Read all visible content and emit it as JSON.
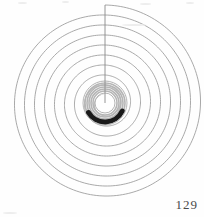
{
  "page": {
    "width": 204,
    "height": 217,
    "background_color": "#fefefe",
    "page_number": "129"
  },
  "figure": {
    "name": "archimedean-spiral-diagram",
    "caption": "",
    "center": {
      "x": 105,
      "y": 103
    },
    "radius_line": {
      "label": "vertical radius line",
      "from": {
        "x": 105,
        "y": 5
      },
      "to": {
        "x": 105,
        "y": 103
      },
      "color": "#8a8a8a",
      "width": 0.9
    },
    "spiral": {
      "type": "archimedean",
      "turns": 9,
      "start_radius": 8,
      "end_radius": 98,
      "start_angle_deg": -90,
      "direction": "counterclockwise",
      "stroke_color": "#9a9a9a",
      "stroke_width": 0.85
    },
    "inner_coil": {
      "description": "dense grey inner windings forming a thick ring around a white core",
      "outer_radius": 22,
      "inner_radius": 10,
      "ring_color": "#b5b5b5",
      "core_color": "#ffffff"
    },
    "dark_arc": {
      "description": "thick black arc at lower inner coil",
      "radius": 19,
      "start_angle_deg": 25,
      "end_angle_deg": 150,
      "color": "#1a1a1a",
      "width": 5
    }
  },
  "chart_data": {
    "type": "line",
    "title": "",
    "xlabel": "",
    "ylabel": "",
    "series": [
      {
        "name": "spiral-turn-radii",
        "units": "px",
        "x": [
          1,
          2,
          3,
          4,
          5,
          6,
          7,
          8,
          9
        ],
        "values": [
          8,
          19,
          30,
          41,
          52,
          63,
          74,
          86,
          98
        ]
      }
    ],
    "categories": [
      "turn 1",
      "turn 2",
      "turn 3",
      "turn 4",
      "turn 5",
      "turn 6",
      "turn 7",
      "turn 8",
      "turn 9"
    ],
    "xlim": [
      1,
      9
    ],
    "ylim": [
      0,
      100
    ],
    "grid": false,
    "legend": "none"
  },
  "artifacts": {
    "label": "scanner specks and edge noise",
    "color": "#ededed",
    "items": [
      "speck-top-left",
      "speck-top-mid-left",
      "speck-top-mid-right",
      "speck-top-right",
      "streak-upper-right",
      "speck-bottom-left"
    ]
  }
}
